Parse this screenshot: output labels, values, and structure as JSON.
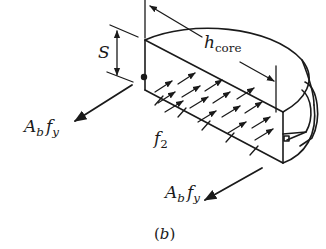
{
  "figure": {
    "caption": "(b)",
    "caption_letter": "b",
    "labels": {
      "spacing": "S",
      "core_height_main": "h",
      "core_height_sub": "core",
      "stress": "f",
      "stress_sub": "2",
      "bar_force_left_A": "A",
      "bar_force_left_b": "b",
      "bar_force_left_f": "f",
      "bar_force_left_y": "y",
      "bar_force_right_A": "A",
      "bar_force_right_b": "b",
      "bar_force_right_f": "f",
      "bar_force_right_y": "y"
    },
    "colors": {
      "ink": "#1a1a1a",
      "background": "#ffffff"
    }
  }
}
